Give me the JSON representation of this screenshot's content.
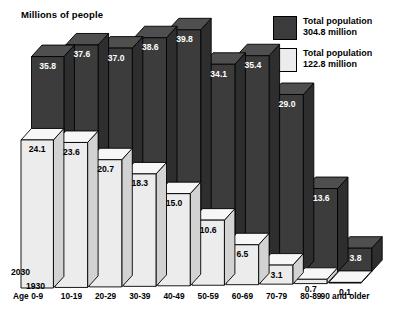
{
  "chart_data": {
    "type": "bar",
    "title": "Millions of people",
    "xlabel": "Age",
    "ylabel": "",
    "grid": false,
    "legend_position": "top-right",
    "ylim": [
      0,
      42
    ],
    "categories": [
      "0-9",
      "10-19",
      "20-29",
      "30-39",
      "40-49",
      "50-59",
      "60-69",
      "70-79",
      "80-89",
      "90 and older"
    ],
    "series": [
      {
        "name": "Total population 304.8 million",
        "year": "2030",
        "color": "#3c3c3c",
        "values": [
          35.8,
          37.6,
          37.0,
          38.6,
          39.8,
          34.1,
          35.4,
          29.0,
          13.6,
          3.8
        ]
      },
      {
        "name": "Total population 122.8 million",
        "year": "1930",
        "color": "#ececec",
        "values": [
          24.1,
          23.6,
          20.7,
          18.3,
          15.0,
          10.6,
          6.5,
          3.1,
          0.7,
          0.1
        ]
      }
    ]
  },
  "header": {
    "title": "Millions of people"
  },
  "legend": {
    "items": [
      {
        "label_line1": "Total population",
        "label_line2": "304.8 million",
        "swatch": "dark"
      },
      {
        "label_line1": "Total population",
        "label_line2": "122.8 million",
        "swatch": "light"
      }
    ]
  },
  "axis": {
    "age_caption": "Age",
    "year_back": "2030",
    "year_front": "1930",
    "categories": [
      "0-9",
      "10-19",
      "20-29",
      "30-39",
      "40-49",
      "50-59",
      "60-69",
      "70-79",
      "80-89",
      "90 and older"
    ]
  }
}
